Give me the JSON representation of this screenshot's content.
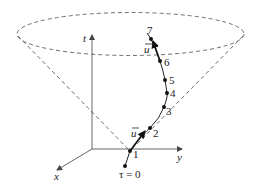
{
  "figure": {
    "axes": {
      "t": {
        "label": "t"
      },
      "x": {
        "label": "x"
      },
      "y": {
        "label": "y"
      }
    },
    "start_label": "τ = 0",
    "events": [
      {
        "label": "1"
      },
      {
        "label": "2"
      },
      {
        "label": "3"
      },
      {
        "label": "4"
      },
      {
        "label": "5"
      },
      {
        "label": "6"
      },
      {
        "label": "7"
      }
    ],
    "vectors": [
      {
        "label": "u",
        "at_event": "1"
      },
      {
        "label": "u",
        "at_event": "7"
      }
    ],
    "colors": {
      "cone": "#6e6e6e",
      "axes": "#555555",
      "worldline": "#222222"
    }
  }
}
